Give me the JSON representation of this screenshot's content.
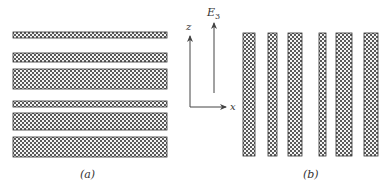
{
  "figure": {
    "panel_a": {
      "label": "(a)",
      "orientation": "horizontal",
      "layers": [
        {
          "y": 32,
          "height": 6
        },
        {
          "y": 53,
          "height": 9
        },
        {
          "y": 69,
          "height": 20
        },
        {
          "y": 101,
          "height": 6
        },
        {
          "y": 113,
          "height": 17
        },
        {
          "y": 137,
          "height": 20
        }
      ]
    },
    "axes": {
      "z_label": "z",
      "x_label": "x",
      "field_label_base": "E",
      "field_label_sub": "3"
    },
    "panel_b": {
      "label": "(b)",
      "orientation": "vertical",
      "layers": [
        {
          "x": 243,
          "width": 12
        },
        {
          "x": 268,
          "width": 9
        },
        {
          "x": 288,
          "width": 14
        },
        {
          "x": 319,
          "width": 7
        },
        {
          "x": 336,
          "width": 16
        },
        {
          "x": 364,
          "width": 14
        }
      ]
    },
    "colors": {
      "hatch": "#555555",
      "border": "#333333",
      "background": "#ffffff"
    }
  }
}
